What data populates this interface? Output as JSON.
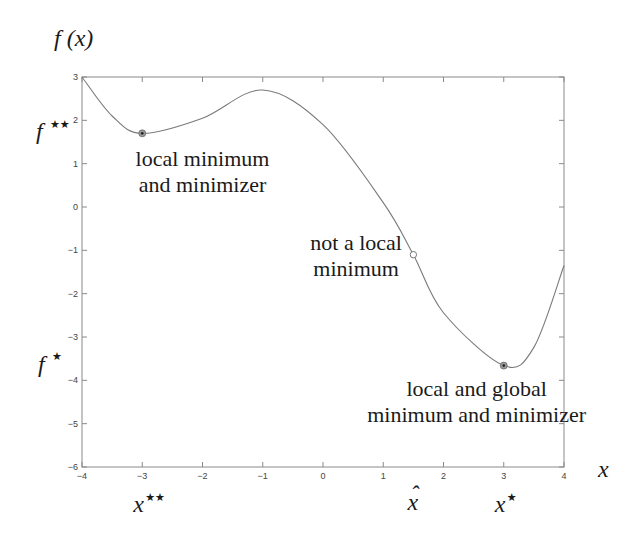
{
  "chart_data": {
    "type": "line",
    "title": "",
    "ylabel": "f(x)",
    "xlabel": "x",
    "xlim": [
      -4,
      4
    ],
    "ylim": [
      -6,
      3
    ],
    "xticks": [
      -4,
      -3,
      -2,
      -1,
      0,
      1,
      2,
      3,
      4
    ],
    "yticks": [
      -6,
      -5,
      -4,
      -3,
      -2,
      -1,
      0,
      1,
      2,
      3
    ],
    "xtick_labels": [
      "−4",
      "−3",
      "−2",
      "−1",
      "0",
      "1",
      "2",
      "3",
      "4"
    ],
    "ytick_labels": [
      "−6",
      "−5",
      "−4",
      "−3",
      "−2",
      "−1",
      "0",
      "1",
      "2",
      "3"
    ],
    "grid": false,
    "series": [
      {
        "name": "f(x)",
        "color": "#7a7a7a",
        "x": [
          -4,
          -3.5,
          -3,
          -2,
          -1,
          0,
          1,
          1.5,
          2,
          3,
          3.5,
          4
        ],
        "y": [
          3,
          2.1,
          1.7,
          2.05,
          2.7,
          1.9,
          0.1,
          -1.1,
          -2.44,
          -3.66,
          -3.24,
          -1.35
        ]
      }
    ],
    "markers": [
      {
        "name": "local-minimizer",
        "x": -3,
        "y": 1.7,
        "style": "filled"
      },
      {
        "name": "not-local-minimum",
        "x": 1.5,
        "y": -1.1,
        "style": "open"
      },
      {
        "name": "global-minimizer",
        "x": 3,
        "y": -3.66,
        "style": "filled"
      }
    ],
    "annotations": [
      {
        "name": "local-minimum-note",
        "lines": [
          "local minimum",
          "and minimizer"
        ],
        "x": -2.0,
        "y": 0.95
      },
      {
        "name": "not-local-minimum-note",
        "lines": [
          "not a local",
          "minimum"
        ],
        "x": 0.55,
        "y": -1.0
      },
      {
        "name": "global-minimum-note",
        "lines": [
          "local and global",
          "minimum and minimizer"
        ],
        "x": 2.55,
        "y": -4.35
      }
    ],
    "axis_symbols": {
      "y_title": "f (x)",
      "x_title": "x",
      "f_star_star": {
        "base": "f",
        "sup": "★★",
        "y": 1.7
      },
      "f_star": {
        "base": "f",
        "sup": "★",
        "y": -3.66
      },
      "x_star_star": {
        "base": "x",
        "sup": "★★",
        "x": -3
      },
      "x_hat": {
        "base": "x",
        "accent": "ˆ",
        "x": 1.5
      },
      "x_star": {
        "base": "x",
        "sup": "★",
        "x": 3
      }
    }
  }
}
